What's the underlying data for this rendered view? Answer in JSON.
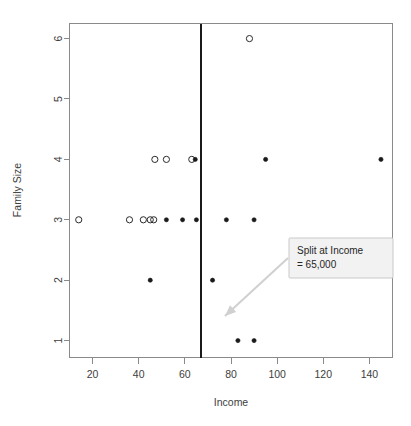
{
  "chart_data": {
    "type": "scatter",
    "title": "",
    "xlabel": "Income",
    "ylabel": "Family Size",
    "xlim": [
      10,
      150
    ],
    "ylim": [
      0.72,
      6.25
    ],
    "grid": false,
    "legend": "none",
    "xticks": [
      20,
      40,
      60,
      80,
      100,
      120,
      140
    ],
    "yticks": [
      1,
      2,
      3,
      4,
      5,
      6
    ],
    "xtick_labels": [
      "20",
      "40",
      "60",
      "80",
      "100",
      "120",
      "140"
    ],
    "ytick_labels": [
      "1",
      "2",
      "3",
      "4",
      "5",
      "6"
    ],
    "series": [
      {
        "name": "open",
        "marker": "open-circle",
        "points": [
          {
            "x": 14,
            "y": 3
          },
          {
            "x": 36,
            "y": 3
          },
          {
            "x": 42,
            "y": 3
          },
          {
            "x": 45,
            "y": 3
          },
          {
            "x": 46.5,
            "y": 3
          },
          {
            "x": 47,
            "y": 4
          },
          {
            "x": 52,
            "y": 4
          },
          {
            "x": 63,
            "y": 4
          },
          {
            "x": 88,
            "y": 6
          }
        ]
      },
      {
        "name": "filled",
        "marker": "filled-circle",
        "points": [
          {
            "x": 45,
            "y": 2
          },
          {
            "x": 52,
            "y": 3
          },
          {
            "x": 59,
            "y": 3
          },
          {
            "x": 65,
            "y": 3
          },
          {
            "x": 64.5,
            "y": 4
          },
          {
            "x": 72,
            "y": 2
          },
          {
            "x": 78,
            "y": 3
          },
          {
            "x": 83,
            "y": 1
          },
          {
            "x": 90,
            "y": 1
          },
          {
            "x": 90,
            "y": 3
          },
          {
            "x": 95,
            "y": 4
          },
          {
            "x": 145,
            "y": 4
          }
        ]
      }
    ],
    "annotations": [
      {
        "id": "split-callout",
        "text_line_1": "Split at Income",
        "text_line_2": "= 65,000",
        "box_color": "#f2f2f2",
        "border_color": "#c9c9c9",
        "arrow_color": "#d0d0d0"
      }
    ],
    "reference_lines": [
      {
        "id": "split-line",
        "orientation": "vertical",
        "value": 67,
        "color": "#1a1a1a",
        "label": "Split at Income = 65,000"
      }
    ]
  },
  "axes": {
    "x_title": "Income",
    "y_title": "Family Size"
  },
  "callout": {
    "line1": "Split at Income",
    "line2": "= 65,000"
  },
  "colors": {
    "frame": "#8a8a8a",
    "point": "#1a1a1a",
    "split": "#1a1a1a",
    "callout_bg": "#f2f2f2",
    "callout_border": "#c9c9c9",
    "arrow": "#d0d0d0",
    "text": "#3d3d3d"
  }
}
